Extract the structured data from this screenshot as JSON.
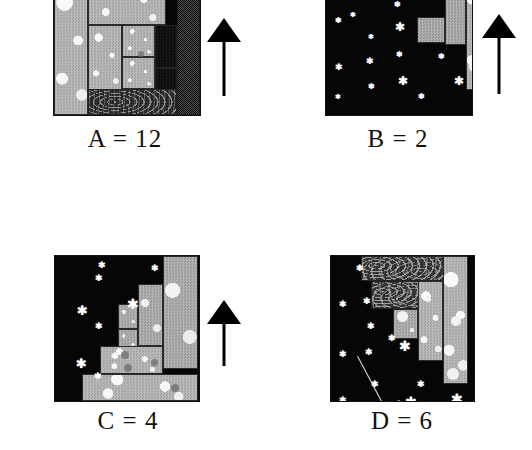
{
  "figure": {
    "panel_count": 4,
    "background_color": "#ffffff",
    "sky_color": "#060606",
    "star_color": "#ffffff",
    "arrow_color": "#000000"
  },
  "panels": [
    {
      "id": "A",
      "caption": "A = 12",
      "letter": "A",
      "value": "12",
      "has_arrow": true,
      "arrow_direction": "up",
      "arrow_name": "up-arrow-icon",
      "cropped_top": true,
      "scene": {
        "x": 53,
        "y": -24,
        "w": 146,
        "h": 138,
        "stars": [],
        "meteors": [],
        "blocks": [
          {
            "name": "block-left-tall-light",
            "texture": "tex-light",
            "x": 0,
            "y": 0,
            "w": 34,
            "h": 138
          },
          {
            "name": "block-top-wide-light",
            "texture": "tex-light",
            "x": 34,
            "y": 0,
            "w": 78,
            "h": 48
          },
          {
            "name": "block-mid-left-light",
            "texture": "tex-light",
            "x": 34,
            "y": 48,
            "w": 34,
            "h": 66
          },
          {
            "name": "block-mid-upper-light",
            "texture": "tex-light",
            "x": 68,
            "y": 48,
            "w": 33,
            "h": 32
          },
          {
            "name": "block-mid-lower-light",
            "texture": "tex-light",
            "x": 68,
            "y": 80,
            "w": 33,
            "h": 32
          },
          {
            "name": "block-dark-upper",
            "texture": "tex-dark",
            "x": 101,
            "y": 48,
            "w": 22,
            "h": 43
          },
          {
            "name": "block-dark-right-upper",
            "texture": "tex-dark",
            "x": 123,
            "y": 48,
            "w": 23,
            "h": 43
          },
          {
            "name": "block-dark-mid",
            "texture": "tex-dark",
            "x": 101,
            "y": 91,
            "w": 22,
            "h": 31
          },
          {
            "name": "block-dark-right-mid",
            "texture": "tex-dark",
            "x": 123,
            "y": 91,
            "w": 23,
            "h": 31
          },
          {
            "name": "block-marble-mid",
            "texture": "tex-marble",
            "x": 68,
            "y": 112,
            "w": 33,
            "h": 22
          },
          {
            "name": "block-dark-lower-right",
            "texture": "tex-dark",
            "x": 101,
            "y": 122,
            "w": 22,
            "h": 16
          },
          {
            "name": "block-streak-bottom",
            "texture": "tex-streak",
            "x": 34,
            "y": 112,
            "w": 89,
            "h": 26
          },
          {
            "name": "block-noise-right-column",
            "texture": "tex-noise",
            "x": 123,
            "y": 0,
            "w": 23,
            "h": 138
          }
        ],
        "pebbles": [
          {
            "x": 84,
            "y": 74,
            "d": 6
          }
        ],
        "whitedots": []
      },
      "arrow": {
        "x": 207,
        "y": 18,
        "w": 34,
        "h": 78
      }
    },
    {
      "id": "B",
      "caption": "B = 2",
      "letter": "B",
      "value": "2",
      "has_arrow": true,
      "arrow_direction": "up",
      "arrow_name": "up-arrow-icon",
      "cropped_top": true,
      "scene": {
        "x": 325,
        "y": -24,
        "w": 146,
        "h": 138,
        "stars": [
          {
            "x": 9,
            "y": 44,
            "size": 8
          },
          {
            "x": 9,
            "y": 90,
            "size": 9
          },
          {
            "x": 9,
            "y": 120,
            "size": 7
          },
          {
            "x": 42,
            "y": 18,
            "size": 8
          },
          {
            "x": 42,
            "y": 60,
            "size": 7
          },
          {
            "x": 42,
            "y": 110,
            "size": 8
          },
          {
            "x": 40,
            "y": 84,
            "size": 9
          },
          {
            "x": 24,
            "y": 38,
            "size": 7
          },
          {
            "x": 68,
            "y": 28,
            "size": 8
          },
          {
            "x": 70,
            "y": 78,
            "size": 8
          },
          {
            "x": 72,
            "y": 104,
            "size": 12
          },
          {
            "x": 69,
            "y": 50,
            "size": 12
          },
          {
            "x": 92,
            "y": 120,
            "size": 8
          },
          {
            "x": 93,
            "y": 2,
            "size": 13
          },
          {
            "x": 112,
            "y": 80,
            "size": 8
          },
          {
            "x": 128,
            "y": 104,
            "size": 12
          }
        ],
        "meteors": [],
        "blocks": [
          {
            "name": "block-grey-small",
            "texture": "tex-grey",
            "x": 91,
            "y": 40,
            "w": 28,
            "h": 26
          },
          {
            "name": "block-grey-tall-mid",
            "texture": "tex-grey",
            "x": 119,
            "y": 0,
            "w": 21,
            "h": 68
          },
          {
            "name": "block-light-tall-right",
            "texture": "tex-light",
            "x": 140,
            "y": 0,
            "w": 22,
            "h": 113
          }
        ],
        "pebbles": [],
        "whitedots": [
          {
            "x": 146,
            "y": 60,
            "d": 13
          },
          {
            "x": 143,
            "y": 84,
            "d": 11
          },
          {
            "x": 147,
            "y": 4,
            "d": 9
          }
        ]
      },
      "arrow": {
        "x": 482,
        "y": 14,
        "w": 34,
        "h": 80
      }
    },
    {
      "id": "C",
      "caption": "C = 4",
      "letter": "C",
      "value": "4",
      "has_arrow": true,
      "arrow_direction": "up",
      "arrow_name": "up-arrow-icon",
      "cropped_top": false,
      "scene": {
        "x": 54,
        "y": 255,
        "w": 144,
        "h": 145,
        "stars": [
          {
            "x": 22,
            "y": 55,
            "size": 13
          },
          {
            "x": 21,
            "y": 108,
            "size": 13
          },
          {
            "x": 22,
            "y": 160,
            "size": 0
          },
          {
            "x": 20,
            "y": 152,
            "size": 13
          },
          {
            "x": 40,
            "y": 22,
            "size": 9
          },
          {
            "x": 40,
            "y": 70,
            "size": 9
          },
          {
            "x": 39,
            "y": 120,
            "size": 9
          },
          {
            "x": 62,
            "y": 25,
            "size": 0
          },
          {
            "x": 56,
            "y": 100,
            "size": 9
          },
          {
            "x": 72,
            "y": 48,
            "size": 14
          },
          {
            "x": 96,
            "y": 12,
            "size": 9
          },
          {
            "x": 43,
            "y": 9,
            "size": 9
          },
          {
            "x": 88,
            "y": 9,
            "size": 0
          }
        ],
        "meteors": [],
        "blocks": [
          {
            "name": "block-step4-light",
            "texture": "tex-grey-dot",
            "x": 108,
            "y": 0,
            "w": 35,
            "h": 113
          },
          {
            "name": "block-step3-light",
            "texture": "tex-grey-dot",
            "x": 83,
            "y": 28,
            "w": 25,
            "h": 62
          },
          {
            "name": "block-step2-upper",
            "texture": "tex-grey-dot",
            "x": 63,
            "y": 48,
            "w": 20,
            "h": 25
          },
          {
            "name": "block-step2-lower",
            "texture": "tex-grey-dot",
            "x": 63,
            "y": 73,
            "w": 20,
            "h": 22
          },
          {
            "name": "block-row-mid-wide",
            "texture": "tex-light",
            "x": 45,
            "y": 90,
            "w": 63,
            "h": 28
          },
          {
            "name": "block-row-bottom-wide",
            "texture": "tex-light",
            "x": 27,
            "y": 118,
            "w": 116,
            "h": 27
          }
        ],
        "pebbles": [
          {
            "x": 66,
            "y": 95,
            "d": 8
          },
          {
            "x": 69,
            "y": 108,
            "d": 8
          },
          {
            "x": 96,
            "y": 103,
            "d": 7
          },
          {
            "x": 116,
            "y": 128,
            "d": 8
          }
        ],
        "whitedots": []
      },
      "arrow": {
        "x": 207,
        "y": 300,
        "w": 34,
        "h": 66
      }
    },
    {
      "id": "D",
      "caption": "D = 6",
      "letter": "D",
      "value": "6",
      "has_arrow": false,
      "arrow_direction": "",
      "arrow_name": "",
      "cropped_top": false,
      "scene": {
        "x": 330,
        "y": 255,
        "w": 143,
        "h": 145,
        "stars": [
          {
            "x": 8,
            "y": 48,
            "size": 9
          },
          {
            "x": 8,
            "y": 98,
            "size": 9
          },
          {
            "x": 8,
            "y": 144,
            "size": 9
          },
          {
            "x": 25,
            "y": 12,
            "size": 9
          },
          {
            "x": 36,
            "y": 70,
            "size": 9
          },
          {
            "x": 32,
            "y": 45,
            "size": 9
          },
          {
            "x": 34,
            "y": 96,
            "size": 9
          },
          {
            "x": 40,
            "y": 128,
            "size": 9
          },
          {
            "x": 38,
            "y": 148,
            "size": 0
          },
          {
            "x": 60,
            "y": 120,
            "size": 0
          },
          {
            "x": 57,
            "y": 82,
            "size": 9
          },
          {
            "x": 64,
            "y": 148,
            "size": 9
          },
          {
            "x": 68,
            "y": 90,
            "size": 14
          },
          {
            "x": 74,
            "y": 146,
            "size": 14
          },
          {
            "x": 86,
            "y": 128,
            "size": 9
          },
          {
            "x": 104,
            "y": 152,
            "size": 9
          },
          {
            "x": 120,
            "y": 143,
            "size": 14
          }
        ],
        "meteors": [
          {
            "x": 27,
            "y": 100,
            "len": 62,
            "angle": 62
          }
        ],
        "blocks": [
          {
            "name": "block-marble-top",
            "texture": "tex-marble",
            "x": 30,
            "y": 0,
            "w": 83,
            "h": 25
          },
          {
            "name": "block-marble-second",
            "texture": "tex-marble",
            "x": 40,
            "y": 25,
            "w": 60,
            "h": 28
          },
          {
            "name": "block-grey-small-mid",
            "texture": "tex-grey-dot",
            "x": 62,
            "y": 53,
            "w": 25,
            "h": 30
          },
          {
            "name": "block-grey-tall-mid",
            "texture": "tex-light",
            "x": 87,
            "y": 25,
            "w": 25,
            "h": 80
          },
          {
            "name": "block-light-tall-right",
            "texture": "tex-light",
            "x": 112,
            "y": 0,
            "w": 25,
            "h": 128
          }
        ],
        "pebbles": [],
        "whitedots": [
          {
            "x": 66,
            "y": 55,
            "d": 11
          },
          {
            "x": 120,
            "y": 60,
            "d": 10
          },
          {
            "x": 116,
            "y": 112,
            "d": 12
          },
          {
            "x": 94,
            "y": 40,
            "d": 6
          }
        ]
      },
      "arrow": null
    }
  ],
  "captions": {
    "a": "A = 12",
    "b": "B = 2",
    "c": "C = 4",
    "d": "D = 6"
  },
  "caption_positions": [
    {
      "x": 45,
      "y": 126,
      "w": 160
    },
    {
      "x": 318,
      "y": 126,
      "w": 160
    },
    {
      "x": 48,
      "y": 408,
      "w": 160
    },
    {
      "x": 322,
      "y": 408,
      "w": 160
    }
  ]
}
